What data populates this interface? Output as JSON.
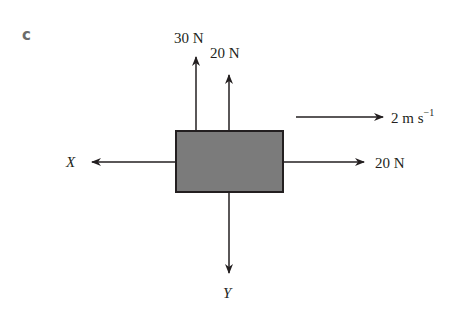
{
  "part_label": "c",
  "forces": {
    "up_left": "30 N",
    "up_right": "20 N",
    "right": "20 N",
    "left": "X",
    "down": "Y"
  },
  "velocity": {
    "value": "2 m s",
    "exponent": "−1"
  },
  "colors": {
    "block_fill": "#7b7b7b",
    "line": "#231f20",
    "label_c": "#6b6b6b"
  }
}
